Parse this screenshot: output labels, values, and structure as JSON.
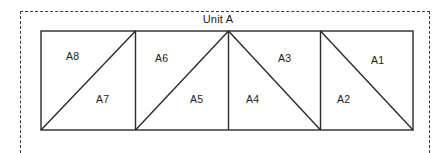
{
  "figure": {
    "title": "Unit A",
    "boundary_style": "dashed",
    "boundary_color": "#3a3a3a",
    "line_color": "#2b2b2b",
    "background_color": "#ffffff"
  },
  "diagram": {
    "type": "truss-panel-schematic",
    "outer_rect": {
      "x": 41,
      "y": 31,
      "width": 372,
      "height": 99
    },
    "vertical_dividers_x": [
      135,
      228,
      320
    ],
    "panels": [
      {
        "index": 1,
        "diagonal": "bottom-left-to-top-right",
        "upper_label": "A8",
        "lower_label": "A7",
        "upper_label_pos": {
          "x": 66,
          "y": 50
        },
        "lower_label_pos": {
          "x": 96,
          "y": 93
        }
      },
      {
        "index": 2,
        "diagonal": "bottom-left-to-top-right",
        "upper_label": "A6",
        "lower_label": "A5",
        "upper_label_pos": {
          "x": 155,
          "y": 52
        },
        "lower_label_pos": {
          "x": 190,
          "y": 93
        }
      },
      {
        "index": 3,
        "diagonal": "top-left-to-bottom-right",
        "upper_label": "A3",
        "lower_label": "A4",
        "upper_label_pos": {
          "x": 278,
          "y": 52
        },
        "lower_label_pos": {
          "x": 246,
          "y": 93
        }
      },
      {
        "index": 4,
        "diagonal": "top-left-to-bottom-right",
        "upper_label": "A1",
        "lower_label": "A2",
        "upper_label_pos": {
          "x": 371,
          "y": 54
        },
        "lower_label_pos": {
          "x": 337,
          "y": 93
        }
      }
    ],
    "member_labels": [
      "A1",
      "A2",
      "A3",
      "A4",
      "A5",
      "A6",
      "A7",
      "A8"
    ]
  }
}
